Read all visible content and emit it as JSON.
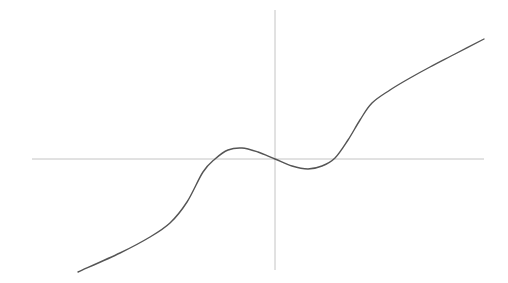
{
  "chart_data": {
    "type": "line",
    "title": "",
    "xlabel": "",
    "ylabel": "",
    "grid": false,
    "legend": null,
    "colors": {
      "axis": "#c4c4c4",
      "curve": "#555555",
      "background": "#ffffff"
    },
    "axes_pixels": {
      "x_axis": {
        "x1": 32,
        "x2": 484,
        "y": 159
      },
      "y_axis": {
        "x": 275,
        "y1": 10,
        "y2": 270
      }
    },
    "series": [
      {
        "name": "curve",
        "points_px": [
          [
            78,
            272
          ],
          [
            120,
            253
          ],
          [
            150,
            237
          ],
          [
            170,
            223
          ],
          [
            187,
            202
          ],
          [
            203,
            172
          ],
          [
            215,
            159
          ],
          [
            228,
            150
          ],
          [
            242,
            148
          ],
          [
            258,
            152
          ],
          [
            275,
            159
          ],
          [
            292,
            166
          ],
          [
            308,
            169
          ],
          [
            322,
            166
          ],
          [
            335,
            158
          ],
          [
            348,
            140
          ],
          [
            360,
            120
          ],
          [
            372,
            103
          ],
          [
            390,
            90
          ],
          [
            410,
            78
          ],
          [
            430,
            67
          ],
          [
            455,
            54
          ],
          [
            484,
            39
          ]
        ]
      }
    ],
    "features": {
      "local_max_px": [
        242,
        148
      ],
      "local_min_px": [
        308,
        169
      ],
      "zero_crossings_px": [
        [
          215,
          159
        ],
        [
          275,
          159
        ],
        [
          335,
          159
        ]
      ]
    }
  }
}
